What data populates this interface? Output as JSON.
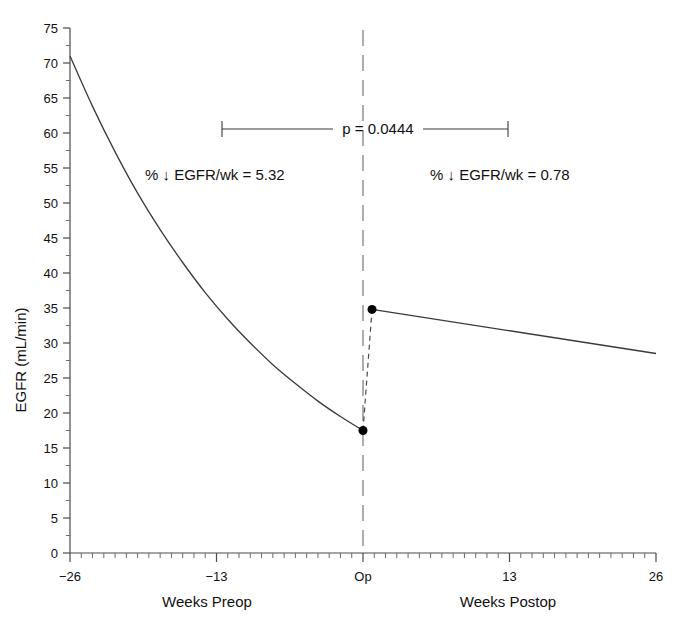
{
  "chart_data": {
    "type": "line",
    "title": "",
    "xlabel_left": "Weeks Preop",
    "xlabel_right": "Weeks Postop",
    "ylabel": "EGFR (mL/min)",
    "xlim": [
      -26,
      26
    ],
    "ylim": [
      0,
      75
    ],
    "grid": false,
    "legend": "none",
    "x_ticks": [
      -26,
      -13,
      0,
      13,
      26
    ],
    "x_tick_labels": [
      "−26",
      "−13",
      "Op",
      "13",
      "26"
    ],
    "x_minor_tick_step": 1,
    "y_ticks": [
      0,
      5,
      10,
      15,
      20,
      25,
      30,
      35,
      40,
      45,
      50,
      55,
      60,
      65,
      70,
      75
    ],
    "y_tick_labels": [
      "0",
      "5",
      "10",
      "15",
      "20",
      "25",
      "30",
      "35",
      "40",
      "45",
      "50",
      "55",
      "60",
      "65",
      "70",
      "75"
    ],
    "y_minor_tick_step": 2.5,
    "series": [
      {
        "name": "Preop EGFR",
        "style": "solid",
        "x": [
          -26,
          -24,
          -22,
          -20,
          -18,
          -16,
          -14,
          -12,
          -10,
          -8,
          -6,
          -4,
          -2,
          0
        ],
        "values": [
          71.0,
          63.8,
          57.3,
          51.4,
          46.2,
          41.5,
          37.2,
          33.4,
          30.0,
          26.9,
          24.2,
          21.7,
          19.5,
          17.5
        ]
      },
      {
        "name": "Postop EGFR",
        "style": "solid",
        "x": [
          0.8,
          26
        ],
        "values": [
          34.8,
          28.5
        ]
      },
      {
        "name": "Operative step change",
        "style": "dashed",
        "x": [
          0,
          0.8
        ],
        "values": [
          17.5,
          34.8
        ]
      }
    ],
    "markers": [
      {
        "name": "preop-endpoint",
        "x": 0,
        "y": 17.5
      },
      {
        "name": "postop-startpoint",
        "x": 0.8,
        "y": 34.8
      }
    ],
    "annotations": {
      "preop_slope": "% ↓ EGFR/wk = 5.32",
      "postop_slope": "% ↓ EGFR/wk = 0.78",
      "pvalue": "p = 0.0444",
      "pvalue_bracket_from": -13,
      "pvalue_bracket_to": 13,
      "op_marker_label": "Op"
    },
    "colors": {
      "curve": "#3a3a3a",
      "axis": "#4a4a4a",
      "op_line": "#777777",
      "marker": "#000000",
      "background": "#ffffff"
    }
  }
}
